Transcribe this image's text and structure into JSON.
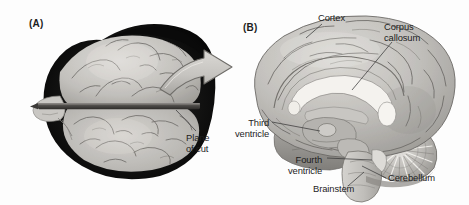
{
  "figure": {
    "background_color": "#fdfdfd",
    "width": 469,
    "height": 205,
    "panels": [
      {
        "tag": "(A)",
        "view": "dorsal view of human brain within opened skull",
        "labels": [
          "Plane of cut"
        ]
      },
      {
        "tag": "(B)",
        "view": "mid-sagittal section of human brain",
        "labels": [
          "Cortex",
          "Corpus callosum",
          "Third ventricle",
          "Fourth ventricle",
          "Brainstem",
          "Cerebellum"
        ]
      }
    ]
  },
  "panel_a": {
    "tag": "(A)",
    "plane_of_cut_label": "Plane\nof cut"
  },
  "panel_b": {
    "tag": "(B)",
    "cortex_label": "Cortex",
    "corpus_callosum_label": "Corpus\ncallosum",
    "third_ventricle_label": "Third\nventricle",
    "fourth_ventricle_label": "Fourth\nventricle",
    "brainstem_label": "Brainstem",
    "cerebellum_label": "Cerebellum"
  },
  "arrow": {
    "name": "transition-arrow",
    "direction": "right",
    "meaning": "section produced by the plane of cut"
  },
  "colors": {
    "background": "#fdfdfd",
    "text": "#1d1d1d",
    "leader_line": "#3a3a3a",
    "brain_tissue_light": "#cfcdc9",
    "brain_tissue_mid": "#b3b1ad",
    "brain_tissue_dark": "#8e8c88",
    "sulcus_line": "#6e6c68",
    "skull_dark": "#141414",
    "white_matter": "#f2f0ec",
    "arrow_fill": "#c9c7c3",
    "arrow_outline": "#6f6d69",
    "cut_bar": "#4a4845"
  }
}
